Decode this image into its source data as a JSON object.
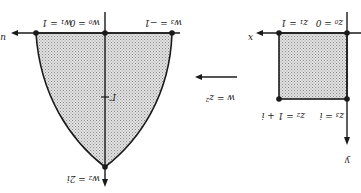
{
  "figure": {
    "orientation": "rotated-180",
    "mapping_label": "w = z²",
    "left_panel": {
      "title": "w-plane image",
      "horizontal_axis_label": "u",
      "vertical_axis_label": "",
      "points": [
        {
          "id": "w1",
          "label": "w₁ = 1"
        },
        {
          "id": "w0",
          "label": "w₀ = 0"
        },
        {
          "id": "w3",
          "label": "w₃ = −1"
        },
        {
          "id": "w2",
          "label": "w₂ = 2i"
        }
      ],
      "curve_label": "Γ"
    },
    "right_panel": {
      "title": "z-plane square",
      "horizontal_axis_label": "x",
      "vertical_axis_label": "y",
      "points": [
        {
          "id": "z1",
          "label": "z₁ = 1"
        },
        {
          "id": "z0",
          "label": "z₀ = 0"
        },
        {
          "id": "z2",
          "label": "z₂ = 1 + i"
        },
        {
          "id": "z3",
          "label": "z₃ = i"
        }
      ]
    },
    "colors": {
      "line": "#1a1a1a",
      "fill": "#c8c8c8",
      "background": "#ffffff"
    }
  }
}
